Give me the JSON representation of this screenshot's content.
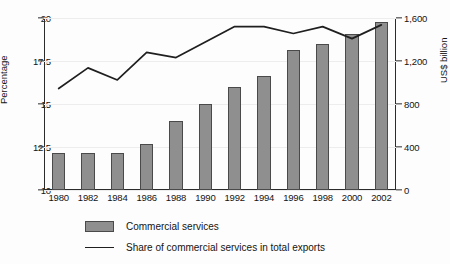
{
  "chart_data": {
    "type": "bar",
    "title": "",
    "subtitle": "",
    "categories": [
      "1980",
      "1982",
      "1984",
      "1986",
      "1988",
      "1990",
      "1992",
      "1994",
      "1996",
      "1998",
      "2000",
      "2002"
    ],
    "series": [
      {
        "name": "Commercial services",
        "chart_type": "bar",
        "axis": "right",
        "unit": "US$ billion",
        "color": "#8f8f8f",
        "values": [
          345,
          340,
          340,
          430,
          640,
          800,
          960,
          1060,
          1300,
          1360,
          1450,
          1565
        ]
      },
      {
        "name": "Share of commercial services in total exports",
        "chart_type": "line",
        "axis": "left",
        "unit": "Percentage",
        "color": "#1f1f1f",
        "values": [
          15.9,
          17.1,
          16.4,
          18.0,
          17.7,
          18.6,
          19.5,
          19.5,
          19.1,
          19.5,
          18.8,
          19.6
        ]
      }
    ],
    "xlabel": "",
    "ylabel": "Percentage",
    "y2label": "US$ billion",
    "ylim": [
      10,
      20
    ],
    "y2lim": [
      0,
      1600
    ],
    "yticks": [
      10,
      12.5,
      15,
      17.5,
      20
    ],
    "ytick_labels": [
      "10",
      "12.5",
      "15",
      "17.5",
      "20"
    ],
    "y2ticks": [
      0,
      400,
      800,
      1200,
      1600
    ],
    "y2tick_labels": [
      "0",
      "400",
      "800",
      "1,200",
      "1,600"
    ],
    "grid": true,
    "legend_position": "bottom-left"
  },
  "axes": {
    "left": {
      "title": "Percentage",
      "ticks": [
        "20",
        "17.5",
        "15",
        "12.5",
        "10"
      ]
    },
    "right": {
      "title": "US$ billion",
      "ticks": [
        "1,600",
        "1,200",
        "800",
        "400",
        "0"
      ]
    },
    "x": {
      "ticks": [
        "1980",
        "1982",
        "1984",
        "1986",
        "1988",
        "1990",
        "1992",
        "1994",
        "1996",
        "1998",
        "2000",
        "2002"
      ]
    }
  },
  "legend": {
    "items": [
      {
        "label": "Commercial services",
        "marker": "bar-swatch"
      },
      {
        "label": "Share of commercial services in total exports",
        "marker": "line-swatch"
      }
    ]
  }
}
